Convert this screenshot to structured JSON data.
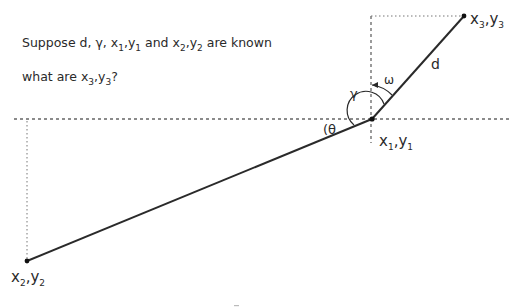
{
  "problem": {
    "line1": {
      "prefix": "Suppose d, γ, ",
      "x1": "x",
      "x1_sub": "1",
      "y1": "y",
      "y1_sub": "1",
      "and": " and ",
      "x2": "x",
      "x2_sub": "2",
      "y2": "y",
      "y2_sub": "2",
      "suffix": " are known"
    },
    "line2": {
      "prefix": "what are ",
      "x3": "x",
      "x3_sub": "3",
      "y3": "y",
      "y3_sub": "3",
      "suffix": "?"
    }
  },
  "points": {
    "p1": {
      "x": "x",
      "xs": "1",
      "y": "y",
      "ys": "1",
      "sep": ","
    },
    "p2": {
      "x": "x",
      "xs": "2",
      "y": "y",
      "ys": "2",
      "sep": ","
    },
    "p3": {
      "x": "x",
      "xs": "3",
      "y": "y",
      "ys": "3",
      "sep": ","
    }
  },
  "labels": {
    "d": "d",
    "gamma": "γ",
    "omega": "ω",
    "theta": "θ",
    "theta_paren": "("
  },
  "colors": {
    "line": "#2a2a2a",
    "dotted": "#666666",
    "background": "#ffffff"
  }
}
